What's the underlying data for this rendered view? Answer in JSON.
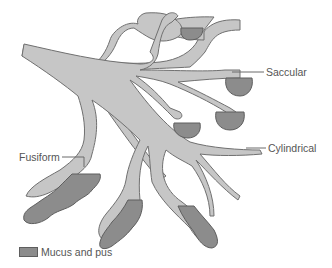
{
  "diagram": {
    "type": "bronchiectasis-illustration",
    "colors": {
      "airway_fill": "#c6c6c6",
      "airway_outline": "#707070",
      "mucus_fill": "#8c8c8c",
      "label_text": "#555555"
    },
    "labels": {
      "saccular": "Saccular",
      "cylindrical": "Cylindrical",
      "fusiform": "Fusiform"
    },
    "legend": {
      "items": [
        {
          "label": "Mucus and pus",
          "color": "#8c8c8c"
        }
      ]
    }
  }
}
